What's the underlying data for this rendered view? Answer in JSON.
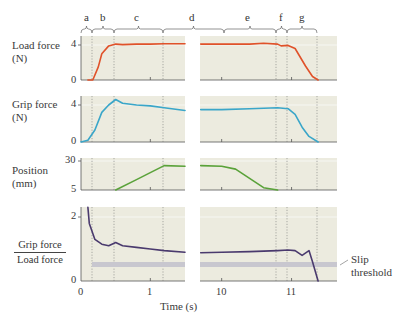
{
  "chart_data": [
    {
      "type": "line",
      "title": "",
      "ylabel": "Load force (N)",
      "yticks": [
        0,
        4
      ],
      "ylim": [
        0,
        4.8
      ],
      "series": [
        {
          "name": "Load force (early)",
          "color": "#e0522a",
          "x": [
            0.1,
            0.17,
            0.25,
            0.3,
            0.4,
            0.5,
            0.6,
            0.8,
            1.0,
            1.2,
            1.5
          ],
          "y": [
            0,
            0,
            1.5,
            3.0,
            3.9,
            4.1,
            4.05,
            4.1,
            4.1,
            4.15,
            4.15
          ]
        },
        {
          "name": "Load force (late)",
          "color": "#e0522a",
          "x": [
            9.7,
            10.0,
            10.2,
            10.4,
            10.6,
            10.8,
            10.85,
            10.95,
            11.05,
            11.2,
            11.3,
            11.38
          ],
          "y": [
            4.1,
            4.1,
            4.1,
            4.1,
            4.2,
            4.1,
            3.9,
            3.95,
            3.6,
            1.6,
            0.4,
            0
          ]
        }
      ]
    },
    {
      "type": "line",
      "ylabel": "Grip force (N)",
      "yticks": [
        0,
        4
      ],
      "ylim": [
        0,
        4.8
      ],
      "series": [
        {
          "name": "Grip force (early)",
          "color": "#3aa6c9",
          "x": [
            0,
            0.1,
            0.2,
            0.3,
            0.4,
            0.5,
            0.6,
            0.8,
            1.0,
            1.2,
            1.5
          ],
          "y": [
            0,
            0.2,
            1.3,
            3.2,
            4.0,
            4.6,
            4.2,
            4.0,
            3.9,
            3.7,
            3.4
          ]
        },
        {
          "name": "Grip force (late)",
          "color": "#3aa6c9",
          "x": [
            9.7,
            10.0,
            10.4,
            10.8,
            10.95,
            11.05,
            11.15,
            11.25,
            11.38
          ],
          "y": [
            3.5,
            3.5,
            3.6,
            3.7,
            3.6,
            3.0,
            1.6,
            0.6,
            0
          ]
        }
      ]
    },
    {
      "type": "line",
      "ylabel": "Position (mm)",
      "yticks": [
        5,
        30
      ],
      "ylim": [
        5,
        32
      ],
      "series": [
        {
          "name": "Position (early)",
          "color": "#5aa23a",
          "x": [
            0.5,
            0.8,
            1.0,
            1.2,
            1.5
          ],
          "y": [
            5,
            14,
            20,
            26,
            25.5
          ]
        },
        {
          "name": "Position (late)",
          "color": "#5aa23a",
          "x": [
            9.7,
            10.0,
            10.2,
            10.4,
            10.6,
            10.8
          ],
          "y": [
            26,
            25.5,
            23,
            15,
            7,
            5
          ]
        }
      ]
    },
    {
      "type": "line",
      "ylabel": "Grip force / Load force",
      "yticks": [
        0,
        2
      ],
      "ylim": [
        0,
        2.3
      ],
      "xlabel": "Time (s)",
      "xticks": [
        0,
        1,
        10,
        11
      ],
      "series": [
        {
          "name": "Ratio (early)",
          "color": "#4a3a6e",
          "x": [
            0.1,
            0.12,
            0.2,
            0.3,
            0.4,
            0.5,
            0.6,
            0.8,
            1.0,
            1.2,
            1.5
          ],
          "y": [
            2.3,
            1.8,
            1.3,
            1.15,
            1.1,
            1.2,
            1.1,
            1.05,
            1.0,
            0.95,
            0.9
          ]
        },
        {
          "name": "Ratio (late)",
          "color": "#4a3a6e",
          "x": [
            9.7,
            10.0,
            10.4,
            10.8,
            10.95,
            11.05,
            11.15,
            11.25,
            11.3,
            11.38
          ],
          "y": [
            0.88,
            0.9,
            0.92,
            0.95,
            0.97,
            0.95,
            0.8,
            0.95,
            0.6,
            0
          ]
        }
      ],
      "annotations": [
        {
          "text": "Slip threshold",
          "y": 0.55
        }
      ]
    }
  ],
  "figure": {
    "panels": [
      {
        "label_line1": "Load force",
        "label_line2": "(N)",
        "ytick_top": "4",
        "ytick_bottom": "0"
      },
      {
        "label_line1": "Grip force",
        "label_line2": "(N)",
        "ytick_top": "4",
        "ytick_bottom": "0"
      },
      {
        "label_line1": "Position",
        "label_line2": "(mm)",
        "ytick_top": "30",
        "ytick_bottom": "5"
      },
      {
        "label_num": "Grip force",
        "label_den": "Load force",
        "ytick_top": "2",
        "ytick_bottom": "0"
      }
    ],
    "segments": [
      "a",
      "b",
      "c",
      "d",
      "e",
      "f",
      "g"
    ],
    "xticks": [
      "0",
      "1",
      "10",
      "11"
    ],
    "xlabel": "Time (s)",
    "slip_line1": "Slip",
    "slip_line2": "threshold",
    "colors": {
      "panel_bg": "#ecebdf",
      "load": "#e0522a",
      "grip": "#3aa6c9",
      "position": "#5aa23a",
      "ratio": "#4a3a6e",
      "slip_band": "#c8c7cf"
    }
  }
}
